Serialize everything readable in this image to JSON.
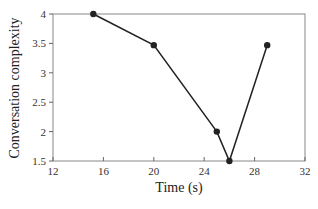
{
  "chart_data": {
    "type": "line",
    "title": "",
    "xlabel": "Time (s)",
    "ylabel": "Conversation complexity",
    "xlim": [
      12,
      32
    ],
    "ylim": [
      1.5,
      4
    ],
    "xticks": [
      12,
      16,
      20,
      24,
      28,
      32
    ],
    "yticks": [
      1.5,
      2,
      2.5,
      3,
      3.5,
      4
    ],
    "grid": false,
    "legend": null,
    "series": [
      {
        "name": "complexity",
        "x": [
          15.2,
          20,
          25,
          26,
          29
        ],
        "y": [
          4,
          3.47,
          2,
          1.5,
          3.47
        ],
        "color": "#222222",
        "marker": "circle"
      }
    ]
  }
}
